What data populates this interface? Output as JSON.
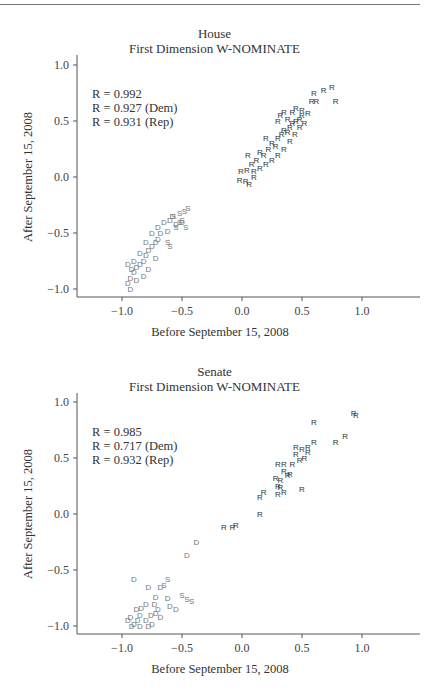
{
  "chart_data": [
    {
      "type": "scatter",
      "title": "House",
      "subtitle": "First Dimension W-NOMINATE",
      "xlabel": "Before September 15, 2008",
      "ylabel": "After September 15, 2008",
      "xlim": [
        -1.25,
        1.4
      ],
      "ylim": [
        -1.1,
        1.1
      ],
      "xticks": [
        "-1.0",
        "-0.5",
        "0.0",
        "0.5",
        "1.0"
      ],
      "yticks": [
        "1.0",
        "0.5",
        "0.0",
        "-0.5",
        "-1.0"
      ],
      "grid": false,
      "legend": "marker letters: D = Democrat, R = Republican, S = Southern Democrat",
      "annotations": [
        "R = 0.992",
        "R = 0.927 (Dem)",
        "R = 0.931 (Rep)"
      ],
      "series": [
        {
          "name": "R",
          "color": "#333333",
          "points": [
            [
              -0.02,
              -0.03
            ],
            [
              0.03,
              -0.04
            ],
            [
              0.06,
              -0.06
            ],
            [
              -0.01,
              0.05
            ],
            [
              0.04,
              0.06
            ],
            [
              0.1,
              0.05
            ],
            [
              0.08,
              0.12
            ],
            [
              0.12,
              0.15
            ],
            [
              0.15,
              0.22
            ],
            [
              0.18,
              0.2
            ],
            [
              0.22,
              0.25
            ],
            [
              0.25,
              0.3
            ],
            [
              0.28,
              0.28
            ],
            [
              0.3,
              0.35
            ],
            [
              0.33,
              0.38
            ],
            [
              0.35,
              0.42
            ],
            [
              0.38,
              0.4
            ],
            [
              0.4,
              0.45
            ],
            [
              0.42,
              0.48
            ],
            [
              0.45,
              0.5
            ],
            [
              0.48,
              0.52
            ],
            [
              0.3,
              0.5
            ],
            [
              0.35,
              0.58
            ],
            [
              0.42,
              0.58
            ],
            [
              0.45,
              0.62
            ],
            [
              0.5,
              0.6
            ],
            [
              0.55,
              0.57
            ],
            [
              0.48,
              0.45
            ],
            [
              0.4,
              0.32
            ],
            [
              0.35,
              0.25
            ],
            [
              0.25,
              0.15
            ],
            [
              0.15,
              0.08
            ],
            [
              0.2,
              0.35
            ],
            [
              0.32,
              0.55
            ],
            [
              0.6,
              0.75
            ],
            [
              0.68,
              0.78
            ],
            [
              0.75,
              0.8
            ],
            [
              0.58,
              0.68
            ],
            [
              0.62,
              0.68
            ],
            [
              0.78,
              0.68
            ],
            [
              0.1,
              0.0
            ],
            [
              0.05,
              0.2
            ],
            [
              0.2,
              0.12
            ],
            [
              0.38,
              0.52
            ],
            [
              0.5,
              0.55
            ],
            [
              0.3,
              0.2
            ],
            [
              0.44,
              0.38
            ],
            [
              0.52,
              0.48
            ]
          ]
        },
        {
          "name": "D",
          "color": "#777777",
          "points": [
            [
              -0.95,
              -0.95
            ],
            [
              -0.93,
              -0.9
            ],
            [
              -0.9,
              -0.85
            ],
            [
              -0.88,
              -0.8
            ],
            [
              -0.85,
              -0.78
            ],
            [
              -0.82,
              -0.75
            ],
            [
              -0.8,
              -0.7
            ],
            [
              -0.78,
              -0.65
            ],
            [
              -0.75,
              -0.62
            ],
            [
              -0.72,
              -0.58
            ],
            [
              -0.7,
              -0.55
            ],
            [
              -0.68,
              -0.5
            ],
            [
              -0.92,
              -0.82
            ],
            [
              -0.9,
              -0.75
            ],
            [
              -0.85,
              -0.68
            ],
            [
              -0.8,
              -0.58
            ],
            [
              -0.75,
              -0.5
            ],
            [
              -0.7,
              -0.45
            ],
            [
              -0.65,
              -0.4
            ],
            [
              -0.6,
              -0.38
            ],
            [
              -0.55,
              -0.42
            ],
            [
              -0.62,
              -0.48
            ],
            [
              -0.95,
              -0.78
            ],
            [
              -0.93,
              -1.0
            ],
            [
              -0.88,
              -0.92
            ],
            [
              -0.82,
              -0.88
            ],
            [
              -0.78,
              -0.82
            ],
            [
              -0.72,
              -0.72
            ],
            [
              -0.58,
              -0.35
            ],
            [
              -0.5,
              -0.4
            ]
          ]
        },
        {
          "name": "S",
          "color": "#777777",
          "points": [
            [
              -0.57,
              -0.35
            ],
            [
              -0.52,
              -0.32
            ],
            [
              -0.48,
              -0.3
            ],
            [
              -0.45,
              -0.28
            ],
            [
              -0.5,
              -0.38
            ],
            [
              -0.55,
              -0.45
            ],
            [
              -0.52,
              -0.4
            ],
            [
              -0.62,
              -0.58
            ],
            [
              -0.6,
              -0.62
            ],
            [
              -0.47,
              -0.45
            ]
          ]
        }
      ]
    },
    {
      "type": "scatter",
      "title": "Senate",
      "subtitle": "First Dimension W-NOMINATE",
      "xlabel": "Before September 15, 2008",
      "ylabel": "After September 15, 2008",
      "xlim": [
        -1.25,
        1.4
      ],
      "ylim": [
        -1.1,
        1.1
      ],
      "xticks": [
        "-1.0",
        "-0.5",
        "0.0",
        "0.5",
        "1.0"
      ],
      "yticks": [
        "1.0",
        "0.5",
        "0.0",
        "-0.5",
        "-1.0"
      ],
      "grid": false,
      "legend": "marker letters: D = Democrat, R = Republican, S = Southern Democrat",
      "annotations": [
        "R = 0.985",
        "R = 0.717 (Dem)",
        "R = 0.932 (Rep)"
      ],
      "series": [
        {
          "name": "R",
          "color": "#333333",
          "points": [
            [
              0.93,
              0.9
            ],
            [
              0.95,
              0.88
            ],
            [
              0.6,
              0.82
            ],
            [
              0.86,
              0.7
            ],
            [
              0.78,
              0.64
            ],
            [
              0.6,
              0.64
            ],
            [
              0.55,
              0.6
            ],
            [
              0.45,
              0.6
            ],
            [
              0.5,
              0.58
            ],
            [
              0.45,
              0.54
            ],
            [
              0.52,
              0.5
            ],
            [
              0.48,
              0.48
            ],
            [
              0.35,
              0.45
            ],
            [
              0.3,
              0.45
            ],
            [
              0.35,
              0.38
            ],
            [
              0.38,
              0.35
            ],
            [
              0.4,
              0.36
            ],
            [
              0.32,
              0.3
            ],
            [
              0.28,
              0.32
            ],
            [
              0.3,
              0.25
            ],
            [
              0.32,
              0.24
            ],
            [
              0.5,
              0.22
            ],
            [
              0.35,
              0.2
            ],
            [
              0.3,
              0.18
            ],
            [
              0.15,
              0.15
            ],
            [
              0.18,
              0.2
            ],
            [
              0.15,
              0.0
            ],
            [
              -0.15,
              -0.12
            ],
            [
              -0.08,
              -0.12
            ],
            [
              -0.05,
              -0.1
            ],
            [
              0.42,
              0.45
            ],
            [
              0.55,
              0.55
            ]
          ]
        },
        {
          "name": "D",
          "color": "#777777",
          "points": [
            [
              -0.38,
              -0.25
            ],
            [
              -0.46,
              -0.37
            ],
            [
              -0.9,
              -0.58
            ],
            [
              -0.68,
              -0.65
            ],
            [
              -0.78,
              -0.65
            ],
            [
              -0.72,
              -0.74
            ],
            [
              -0.88,
              -0.85
            ],
            [
              -0.84,
              -0.84
            ],
            [
              -0.8,
              -0.8
            ],
            [
              -0.73,
              -0.8
            ],
            [
              -0.7,
              -0.85
            ],
            [
              -0.62,
              -0.75
            ],
            [
              -0.6,
              -0.82
            ],
            [
              -0.55,
              -0.85
            ],
            [
              -0.93,
              -0.92
            ],
            [
              -0.87,
              -0.95
            ],
            [
              -0.85,
              -0.9
            ],
            [
              -0.8,
              -0.95
            ],
            [
              -0.76,
              -0.9
            ],
            [
              -0.72,
              -0.88
            ],
            [
              -0.68,
              -0.92
            ],
            [
              -0.92,
              -1.0
            ],
            [
              -0.9,
              -0.98
            ],
            [
              -0.85,
              -1.0
            ],
            [
              -0.78,
              -1.0
            ],
            [
              -0.95,
              -0.95
            ],
            [
              -0.75,
              -0.98
            ]
          ]
        },
        {
          "name": "S",
          "color": "#777777",
          "points": [
            [
              -0.62,
              -0.58
            ],
            [
              -0.65,
              -0.63
            ],
            [
              -0.5,
              -0.72
            ],
            [
              -0.46,
              -0.76
            ],
            [
              -0.42,
              -0.78
            ]
          ]
        }
      ]
    }
  ]
}
